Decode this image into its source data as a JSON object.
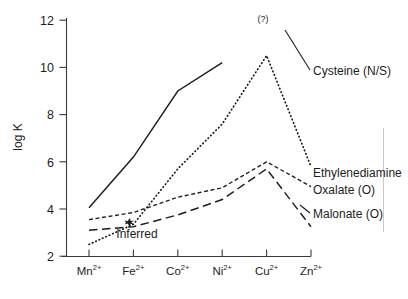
{
  "figure": {
    "y_axis_label": "log K",
    "inferred_annotation": "Inferred",
    "uncertain_annotation": "(?)"
  },
  "chart_data": {
    "type": "line",
    "title": "",
    "xlabel": "",
    "ylabel": "log K",
    "ylim": [
      2,
      12
    ],
    "yticks": [
      2,
      4,
      6,
      8,
      10,
      12
    ],
    "ytick_labels": [
      "2",
      "4",
      "6",
      "8",
      "10",
      "12"
    ],
    "grid": false,
    "legend_position": "right-inline-labels",
    "categories": [
      "Mn2+",
      "Fe2+",
      "Co2+",
      "Ni2+",
      "Cu2+",
      "Zn2+"
    ],
    "category_labels": [
      {
        "base": "Mn",
        "sup": "2+"
      },
      {
        "base": "Fe",
        "sup": "2+"
      },
      {
        "base": "Co",
        "sup": "2+"
      },
      {
        "base": "Ni",
        "sup": "2+"
      },
      {
        "base": "Cu",
        "sup": "2+"
      },
      {
        "base": "Zn",
        "sup": "2+"
      }
    ],
    "series": [
      {
        "name": "Cysteine (N/S)",
        "label": "Cysteine (N/S)",
        "style": "solid",
        "values": [
          4.05,
          6.2,
          9.0,
          10.2,
          null,
          9.75
        ],
        "note": "line broken at Cu2+ where value is uncertain"
      },
      {
        "name": "Ethylenediamine",
        "label": "Ethylenediamine",
        "style": "dotted",
        "values": [
          2.5,
          3.35,
          5.7,
          7.6,
          10.5,
          5.8
        ]
      },
      {
        "name": "Oxalate (O)",
        "label": "Oxalate (O)",
        "style": "short-dash",
        "values": [
          3.55,
          3.85,
          4.5,
          4.9,
          6.0,
          4.95
        ]
      },
      {
        "name": "Malonate (O)",
        "label": "Malonate (O)",
        "style": "long-dash",
        "values": [
          3.1,
          3.25,
          3.75,
          4.4,
          5.7,
          3.25
        ]
      }
    ],
    "annotations": [
      {
        "text": "(?)",
        "near": "Cu2+",
        "value": 11.9
      },
      {
        "text": "Inferred",
        "near": "Fe2+",
        "value": 3.25,
        "marker": "star"
      }
    ]
  },
  "colors": {
    "ink": "#1d1d1d",
    "axis": "#3a3a3a",
    "background": "#ffffff",
    "page_edge": "#c9c9c9"
  }
}
